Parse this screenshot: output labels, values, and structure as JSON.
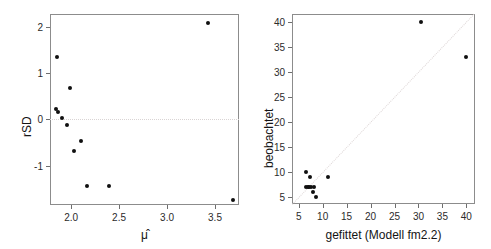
{
  "figure": {
    "title": "",
    "panel_count": 2,
    "background": "#ffffff",
    "point_color": "#101010",
    "frame_color": "#8c8c8c",
    "refline_color": "#ded7d7"
  },
  "chart_data": [
    {
      "type": "scatter",
      "id": "left-panel",
      "title": "",
      "xlabel": "μ̂",
      "ylabel": "rSD",
      "xlim": [
        1.78,
        3.75
      ],
      "ylim": [
        -1.85,
        2.28
      ],
      "xticks": [
        2.0,
        2.5,
        3.0,
        3.5
      ],
      "xticklabels": [
        "2.0",
        "2.5",
        "3.0",
        "3.5"
      ],
      "yticks": [
        -1,
        0,
        1,
        2
      ],
      "yticklabels": [
        "-1",
        "0",
        "1",
        "2"
      ],
      "grid": false,
      "legend": "none",
      "reference_lines": [
        {
          "kind": "horizontal",
          "y": 0,
          "style": "dotted",
          "color": "#d9d4d4"
        }
      ],
      "points": [
        {
          "x": 1.855,
          "y": 1.34
        },
        {
          "x": 1.985,
          "y": 0.67
        },
        {
          "x": 1.845,
          "y": 0.22
        },
        {
          "x": 1.862,
          "y": 0.16
        },
        {
          "x": 1.905,
          "y": 0.03
        },
        {
          "x": 1.952,
          "y": -0.11
        },
        {
          "x": 2.1,
          "y": -0.46
        },
        {
          "x": 2.035,
          "y": -0.69
        },
        {
          "x": 2.165,
          "y": -1.43
        },
        {
          "x": 2.395,
          "y": -1.43
        },
        {
          "x": 3.425,
          "y": 2.08
        },
        {
          "x": 3.685,
          "y": -1.74
        }
      ]
    },
    {
      "type": "scatter",
      "id": "right-panel",
      "title": "",
      "xlabel": "gefittet (Modell fm2.2)",
      "ylabel": "beobachtet",
      "xlim": [
        3.6,
        41.8
      ],
      "ylim": [
        3.6,
        41.5
      ],
      "xticks": [
        5,
        10,
        15,
        20,
        25,
        30,
        35,
        40
      ],
      "xticklabels": [
        "5",
        "10",
        "15",
        "20",
        "25",
        "30",
        "35",
        "40"
      ],
      "yticks": [
        5,
        10,
        15,
        20,
        25,
        30,
        35,
        40
      ],
      "yticklabels": [
        "5",
        "10",
        "15",
        "20",
        "25",
        "30",
        "35",
        "40"
      ],
      "grid": false,
      "legend": "none",
      "reference_lines": [
        {
          "kind": "identity",
          "from": [
            3.6,
            3.6
          ],
          "to": [
            41.5,
            41.5
          ],
          "style": "dotted",
          "color": "#ded7d7"
        }
      ],
      "points": [
        {
          "x": 6.5,
          "y": 10.0
        },
        {
          "x": 7.3,
          "y": 9.0
        },
        {
          "x": 11.1,
          "y": 9.0
        },
        {
          "x": 6.5,
          "y": 7.0
        },
        {
          "x": 6.9,
          "y": 7.0
        },
        {
          "x": 7.2,
          "y": 7.0
        },
        {
          "x": 7.5,
          "y": 7.0
        },
        {
          "x": 8.2,
          "y": 7.0
        },
        {
          "x": 7.9,
          "y": 6.0
        },
        {
          "x": 8.6,
          "y": 5.0
        },
        {
          "x": 30.6,
          "y": 40.0
        },
        {
          "x": 39.9,
          "y": 33.0
        }
      ]
    }
  ]
}
